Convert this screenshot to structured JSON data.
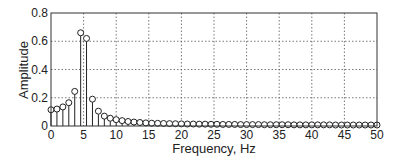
{
  "chart_data": {
    "type": "stem",
    "title": "",
    "xlabel": "Frequency, Hz",
    "ylabel": "Amplitude",
    "xlim": [
      0,
      50
    ],
    "ylim": [
      0,
      0.8
    ],
    "xticks": [
      0,
      5,
      10,
      15,
      20,
      25,
      30,
      35,
      40,
      45,
      50
    ],
    "yticks": [
      0,
      0.2,
      0.4,
      0.6,
      0.8
    ],
    "ytick_labels": [
      "0",
      "0.2",
      "0.4",
      "0.6",
      "0.8"
    ],
    "grid": true,
    "legend": null,
    "x_step": 0.909,
    "series": [
      {
        "name": "Amplitude spectrum",
        "x": [
          0,
          0.91,
          1.82,
          2.73,
          3.64,
          4.55,
          5.45,
          6.36,
          7.27,
          8.18,
          9.09,
          10.0,
          10.91,
          11.82,
          12.73,
          13.64,
          14.55,
          15.45,
          16.36,
          17.27,
          18.18,
          19.09,
          20.0,
          20.91,
          21.82,
          22.73,
          23.64,
          24.55,
          25.45,
          26.36,
          27.27,
          28.18,
          29.09,
          30.0,
          30.91,
          31.82,
          32.73,
          33.64,
          34.55,
          35.45,
          36.36,
          37.27,
          38.18,
          39.09,
          40.0,
          40.91,
          41.82,
          42.73,
          43.64,
          44.55,
          45.45,
          46.36,
          47.27,
          48.18,
          49.09,
          50.0
        ],
        "values": [
          0.115,
          0.12,
          0.135,
          0.165,
          0.245,
          0.66,
          0.62,
          0.19,
          0.105,
          0.07,
          0.055,
          0.045,
          0.038,
          0.032,
          0.028,
          0.025,
          0.022,
          0.02,
          0.019,
          0.018,
          0.017,
          0.016,
          0.015,
          0.014,
          0.014,
          0.013,
          0.013,
          0.012,
          0.012,
          0.011,
          0.011,
          0.011,
          0.01,
          0.01,
          0.01,
          0.01,
          0.009,
          0.009,
          0.009,
          0.009,
          0.009,
          0.008,
          0.008,
          0.008,
          0.008,
          0.008,
          0.008,
          0.008,
          0.007,
          0.007,
          0.007,
          0.007,
          0.007,
          0.007,
          0.007,
          0.007
        ]
      }
    ]
  },
  "labels": {
    "xlabel": "Frequency, Hz",
    "ylabel": "Amplitude"
  }
}
